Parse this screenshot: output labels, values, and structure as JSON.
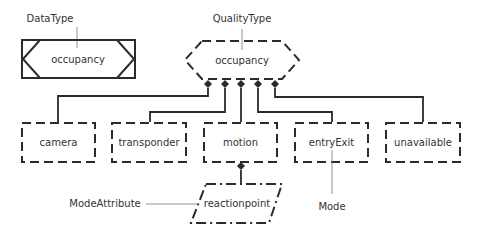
{
  "diagram": {
    "type": "concept-model",
    "colors": {
      "stroke": "#2b2b2b",
      "text": "#333333",
      "background": "#ffffff",
      "leader": "#777777"
    },
    "labels": {
      "data_type": "DataType",
      "quality_type": "QualityType",
      "mode_attribute": "ModeAttribute",
      "mode": "Mode"
    },
    "nodes": {
      "data_type_node": {
        "text": "occupancy",
        "shape": "solid-rectangle-with-chevrons"
      },
      "quality_type_node": {
        "text": "occupancy",
        "shape": "dashed-hexagon"
      },
      "children": [
        {
          "text": "camera",
          "shape": "dashed-rectangle"
        },
        {
          "text": "transponder",
          "shape": "dashed-rectangle"
        },
        {
          "text": "motion",
          "shape": "dashed-rectangle"
        },
        {
          "text": "entryExit",
          "shape": "dashed-rectangle"
        },
        {
          "text": "unavailable",
          "shape": "dashed-rectangle"
        }
      ],
      "mode_attribute_node": {
        "text": "reactionpoint",
        "shape": "dash-dot-parallelogram"
      }
    },
    "edges": [
      {
        "from": "occupancy (QualityType)",
        "to": "camera",
        "marker": "diamond"
      },
      {
        "from": "occupancy (QualityType)",
        "to": "transponder",
        "marker": "diamond"
      },
      {
        "from": "occupancy (QualityType)",
        "to": "motion",
        "marker": "diamond"
      },
      {
        "from": "occupancy (QualityType)",
        "to": "entryExit",
        "marker": "diamond"
      },
      {
        "from": "occupancy (QualityType)",
        "to": "unavailable",
        "marker": "diamond"
      },
      {
        "from": "motion",
        "to": "reactionpoint",
        "marker": "diamond"
      }
    ]
  }
}
